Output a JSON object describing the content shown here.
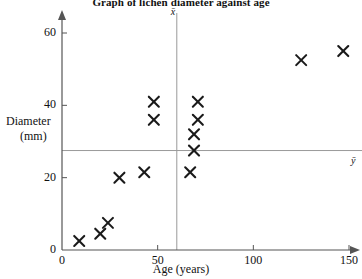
{
  "chart_data": {
    "type": "scatter",
    "title": "Graph of lichen diameter against age",
    "xlabel": "Age (years)",
    "ylabel_line1": "Diameter",
    "ylabel_line2": "(mm)",
    "xlim": [
      0,
      158
    ],
    "ylim": [
      0,
      64
    ],
    "xticks": [
      0,
      50,
      100,
      150
    ],
    "xtick_labels": [
      "0",
      "50",
      "100",
      "150"
    ],
    "yticks": [
      0,
      20,
      40,
      60
    ],
    "ytick_labels": [
      "0",
      "20",
      "40",
      "60"
    ],
    "grid": false,
    "legend": "none",
    "marker": "x",
    "marker_color": "#1a1a1a",
    "axis_color": "#555555",
    "mean_line_color": "#999999",
    "points": [
      {
        "x": 9,
        "y": 2.5
      },
      {
        "x": 20,
        "y": 4.5
      },
      {
        "x": 24,
        "y": 7.5
      },
      {
        "x": 30,
        "y": 20
      },
      {
        "x": 43,
        "y": 21.5
      },
      {
        "x": 48,
        "y": 41
      },
      {
        "x": 48,
        "y": 36
      },
      {
        "x": 67,
        "y": 21.5
      },
      {
        "x": 71,
        "y": 41
      },
      {
        "x": 71,
        "y": 36
      },
      {
        "x": 69,
        "y": 32
      },
      {
        "x": 69,
        "y": 27.5
      },
      {
        "x": 125,
        "y": 52.5
      },
      {
        "x": 147,
        "y": 55
      }
    ],
    "mean_x": {
      "value": 60,
      "label": "x̄"
    },
    "mean_y": {
      "value": 27.5,
      "label": "ȳ"
    }
  }
}
